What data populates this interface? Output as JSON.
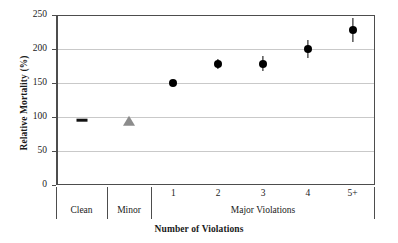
{
  "chart_data": {
    "type": "scatter",
    "title": "",
    "xlabel": "Number of Violations",
    "ylabel": "Relative Mortality (%)",
    "ylim": [
      0,
      250
    ],
    "yticks": [
      0,
      50,
      100,
      150,
      200,
      250
    ],
    "ytick_labels": [
      "0",
      "50",
      "100",
      "150",
      "200",
      "250"
    ],
    "grid": "horizontal",
    "legend": "none",
    "categories": [
      "Clean",
      "Minor",
      "1",
      "2",
      "3",
      "4",
      "5+"
    ],
    "x_group_labels": [
      "Clean",
      "Minor",
      "Major Violations"
    ],
    "x_tick_labels": [
      "",
      "",
      "1",
      "2",
      "3",
      "4",
      "5+"
    ],
    "series": [
      {
        "name": "Relative Mortality",
        "values": [
          95,
          93,
          150,
          178,
          178,
          200,
          228
        ],
        "errors": [
          0,
          0,
          3,
          8,
          11,
          13,
          17
        ],
        "markers": [
          "dash",
          "triangle",
          "circle",
          "circle",
          "circle",
          "circle",
          "circle"
        ],
        "marker_colors": [
          "#111111",
          "#8c8c8c",
          "#000000",
          "#000000",
          "#000000",
          "#000000",
          "#000000"
        ]
      }
    ],
    "axis_color": "#4d4d4d",
    "gridline_color": "#c9c9c9",
    "background": "#ffffff"
  }
}
